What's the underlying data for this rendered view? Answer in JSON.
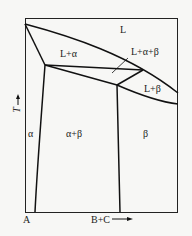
{
  "diagram": {
    "type": "binary phase diagram",
    "regions": {
      "L": "L",
      "L_alpha": "L+α",
      "L_alpha_beta": "L+α+β",
      "L_beta": "L+β",
      "alpha": "α",
      "alpha_beta": "α+β",
      "beta": "β"
    },
    "axes": {
      "x_origin": "A",
      "x_label": "B+C",
      "y_label": "T"
    },
    "colors": {
      "line": "#1a1a1a",
      "background": "#f7f7f5"
    }
  }
}
